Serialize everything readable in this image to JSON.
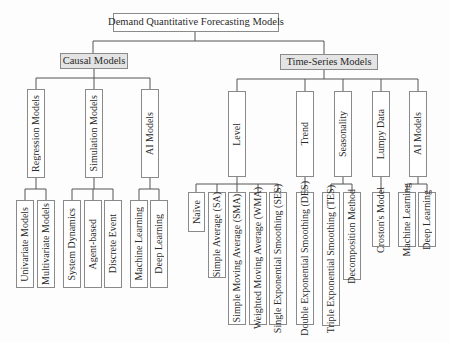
{
  "title": "Demand Quantitative Forecasting Models",
  "causal": {
    "label": "Causal Models",
    "children": [
      {
        "label": "Regression Models",
        "leaves": [
          "Univariate Models",
          "Multivariate Models"
        ]
      },
      {
        "label": "Simulation Models",
        "leaves": [
          "System Dynamics",
          "Agent-based",
          "Discrete Event"
        ]
      },
      {
        "label": "AI Models",
        "leaves": [
          "Machine Learning",
          "Deep Learning"
        ]
      }
    ]
  },
  "timeseries": {
    "label": "Time-Series Models",
    "children": [
      {
        "label": "Level",
        "leaves": [
          "Naïve",
          "Simple Average (SA)",
          "Simple Moving Average (SMA)",
          "Weighted Moving Average (WMA)",
          "Single Exponential Smoothing (SES)"
        ]
      },
      {
        "label": "Trend",
        "leaves": [
          "Double Exponential Smoothing (DES)"
        ]
      },
      {
        "label": "Seasonality",
        "leaves": [
          "Triple Exponential Smoothing (TES)",
          "Decomposition Method"
        ]
      },
      {
        "label": "Lumpy Data",
        "leaves": [
          "Croston's Model"
        ]
      },
      {
        "label": "AI Models",
        "leaves": [
          "Machine Learning",
          "Deep Learning"
        ]
      }
    ]
  },
  "colors": {
    "line": "#555555",
    "border": "#8a8a8a",
    "category_fill": "#e4e4e4",
    "box_fill": "#ffffff"
  }
}
